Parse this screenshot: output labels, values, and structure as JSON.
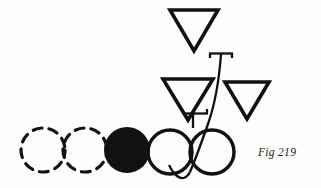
{
  "figure": {
    "caption": "Fig 219",
    "background_color": "#fdfdfc",
    "ink_color": "#111111",
    "stroke_width": 3.2,
    "elements": {
      "dashed_circles": [
        {
          "name": "dashed-circle-1",
          "cx": 43,
          "cy": 150,
          "r": 22,
          "style": "dashed-outline",
          "dash": "9 7"
        },
        {
          "name": "dashed-circle-2",
          "cx": 85,
          "cy": 150,
          "r": 22,
          "style": "dashed-outline",
          "dash": "9 7"
        }
      ],
      "filled_circle": {
        "name": "filled-circle",
        "cx": 127,
        "cy": 150,
        "r": 23,
        "style": "solid-filled"
      },
      "open_circles": [
        {
          "name": "open-circle-left",
          "cx": 170,
          "cy": 152,
          "r": 22,
          "style": "solid-outline"
        },
        {
          "name": "open-circle-right",
          "cx": 212,
          "cy": 152,
          "r": 22,
          "style": "solid-outline"
        }
      ],
      "triangles": [
        {
          "name": "triangle-top",
          "apex_x": 194,
          "apex_y": 51,
          "left_x": 170,
          "right_x": 218,
          "top_y": 9,
          "style": "down-pointing-outline"
        },
        {
          "name": "triangle-lower-left",
          "apex_x": 188,
          "apex_y": 120,
          "left_x": 163,
          "right_x": 213,
          "top_y": 78,
          "style": "down-pointing-outline"
        },
        {
          "name": "triangle-lower-right",
          "apex_x": 247,
          "apex_y": 119,
          "left_x": 225,
          "right_x": 269,
          "top_y": 81,
          "style": "down-pointing-outline"
        }
      ],
      "stem": {
        "name": "spindle-stem",
        "top_bar_y": 53,
        "top_bar_x1": 210,
        "top_bar_x2": 232,
        "mid_bar_y": 113,
        "mid_bar_x1": 185,
        "mid_bar_x2": 207,
        "curve_bottom_y": 180,
        "description": "vertical spindle axis with upper and lower cross bars curving down between the open circles"
      }
    }
  }
}
